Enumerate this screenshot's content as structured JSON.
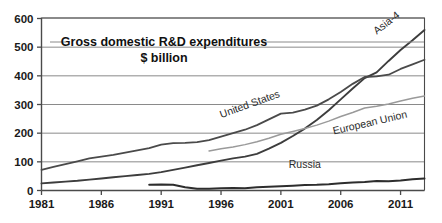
{
  "chart_data": {
    "type": "line",
    "title": "Gross domestic R&D expenditures",
    "subtitle": "$ billion",
    "xlabel": "",
    "ylabel": "",
    "xlim": [
      1981,
      2013
    ],
    "ylim": [
      0,
      600
    ],
    "yticks": [
      0,
      100,
      200,
      300,
      400,
      500,
      600
    ],
    "xticks": [
      1981,
      1986,
      1991,
      1996,
      2001,
      2006,
      2011
    ],
    "grid": true,
    "legend_position": "inline-labels",
    "series": [
      {
        "name": "Asia-4",
        "color": "#3d3d3d",
        "x": [
          1981,
          1982,
          1983,
          1984,
          1985,
          1986,
          1987,
          1988,
          1989,
          1990,
          1991,
          1992,
          1993,
          1994,
          1995,
          1996,
          1997,
          1998,
          1999,
          2000,
          2001,
          2002,
          2003,
          2004,
          2005,
          2006,
          2007,
          2008,
          2009,
          2010,
          2011,
          2012,
          2013
        ],
        "values": [
          25,
          28,
          31,
          34,
          38,
          42,
          46,
          50,
          54,
          58,
          64,
          72,
          80,
          88,
          96,
          104,
          112,
          118,
          128,
          146,
          166,
          190,
          216,
          246,
          280,
          318,
          356,
          392,
          412,
          452,
          490,
          524,
          560
        ]
      },
      {
        "name": "United States",
        "color": "#4a4a4a",
        "x": [
          1981,
          1982,
          1983,
          1984,
          1985,
          1986,
          1987,
          1988,
          1989,
          1990,
          1991,
          1992,
          1993,
          1994,
          1995,
          1996,
          1997,
          1998,
          1999,
          2000,
          2001,
          2002,
          2003,
          2004,
          2005,
          2006,
          2007,
          2008,
          2009,
          2010,
          2011,
          2012,
          2013
        ],
        "values": [
          72,
          82,
          92,
          102,
          112,
          118,
          124,
          132,
          140,
          148,
          160,
          165,
          166,
          169,
          176,
          188,
          200,
          212,
          228,
          248,
          268,
          272,
          282,
          296,
          318,
          344,
          372,
          396,
          398,
          404,
          424,
          440,
          456
        ]
      },
      {
        "name": "European Union",
        "color": "#9a9a9a",
        "x": [
          1995,
          1996,
          1997,
          1998,
          1999,
          2000,
          2001,
          2002,
          2003,
          2004,
          2005,
          2006,
          2007,
          2008,
          2009,
          2010,
          2011,
          2012,
          2013
        ],
        "values": [
          138,
          146,
          152,
          160,
          170,
          182,
          196,
          206,
          216,
          228,
          242,
          258,
          272,
          288,
          294,
          302,
          312,
          322,
          330
        ]
      },
      {
        "name": "Russia",
        "color": "#2d2d2d",
        "x": [
          1990,
          1991,
          1992,
          1993,
          1994,
          1995,
          1996,
          1997,
          1998,
          1999,
          2000,
          2001,
          2002,
          2003,
          2004,
          2005,
          2006,
          2007,
          2008,
          2009,
          2010,
          2011,
          2012,
          2013
        ],
        "values": [
          20,
          21,
          20,
          11,
          6,
          6,
          8,
          9,
          8,
          11,
          13,
          15,
          17,
          19,
          20,
          22,
          25,
          28,
          30,
          33,
          32,
          35,
          39,
          42
        ]
      }
    ],
    "annotations": [
      {
        "text": "Asia-4",
        "x": 2010,
        "y": 575,
        "rotation": -38
      },
      {
        "text": "United States",
        "x": 1998.5,
        "y": 290,
        "rotation": -20
      },
      {
        "text": "European Union",
        "x": 2008.5,
        "y": 225,
        "rotation": -13
      },
      {
        "text": "Russia",
        "x": 2003,
        "y": 78,
        "rotation": 0
      }
    ]
  },
  "axes": {
    "y_labels": [
      "600",
      "500",
      "400",
      "300",
      "200",
      "100",
      "0"
    ],
    "x_labels": [
      "1981",
      "1986",
      "1991",
      "1996",
      "2001",
      "2006",
      "2011"
    ]
  },
  "title": {
    "line1": "Gross domestic R&D expenditures",
    "line2": "$ billion"
  },
  "colors": {
    "axis": "#4a4a4a",
    "grid": "#8a8a8a",
    "text": "#1a1a1a",
    "background": "#ffffff"
  }
}
